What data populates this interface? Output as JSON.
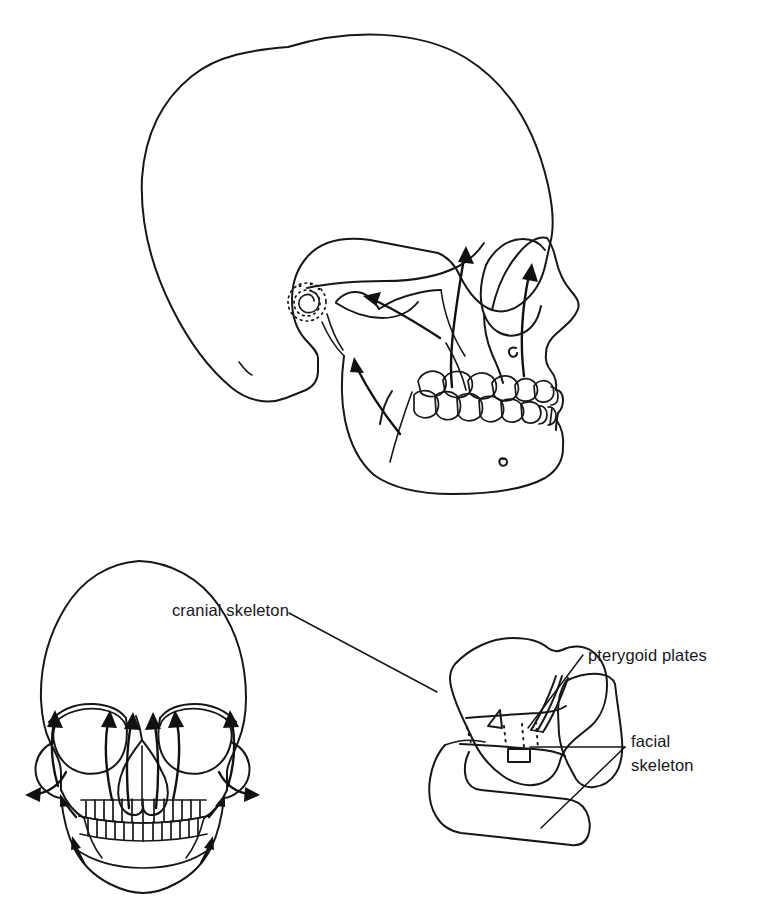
{
  "figure": {
    "background_color": "#ffffff",
    "ink_color": "#17171a",
    "panels": [
      {
        "id": "lateral-skull",
        "name": "lateral-skull-view",
        "description": "Lateral (side) view of human skull with growth displacement arrows"
      },
      {
        "id": "frontal-skull",
        "name": "frontal-skull-view",
        "description": "Frontal (anterior) view of human skull with growth displacement arrows"
      },
      {
        "id": "schematic-skull",
        "name": "schematic-skull-view",
        "description": "Simplified schematic of cranial skeleton, facial skeleton, pterygoid plates and mandible"
      }
    ]
  },
  "labels": {
    "cranial_skeleton": "cranial skeleton",
    "pterygoid_plates": "pterygoid plates",
    "facial_skeleton_line1": "facial",
    "facial_skeleton_line2": "skeleton"
  },
  "annotations": {
    "lateral_arrow_count": 4,
    "frontal_arrow_count": 8,
    "dotted_suture_count": 4,
    "mastoid_spiral": "spiral-dotted-mastoid-marking",
    "mental_foramen": "mental-foramen-marking",
    "infraorbital_foramen": "infraorbital-foramen-marking"
  }
}
